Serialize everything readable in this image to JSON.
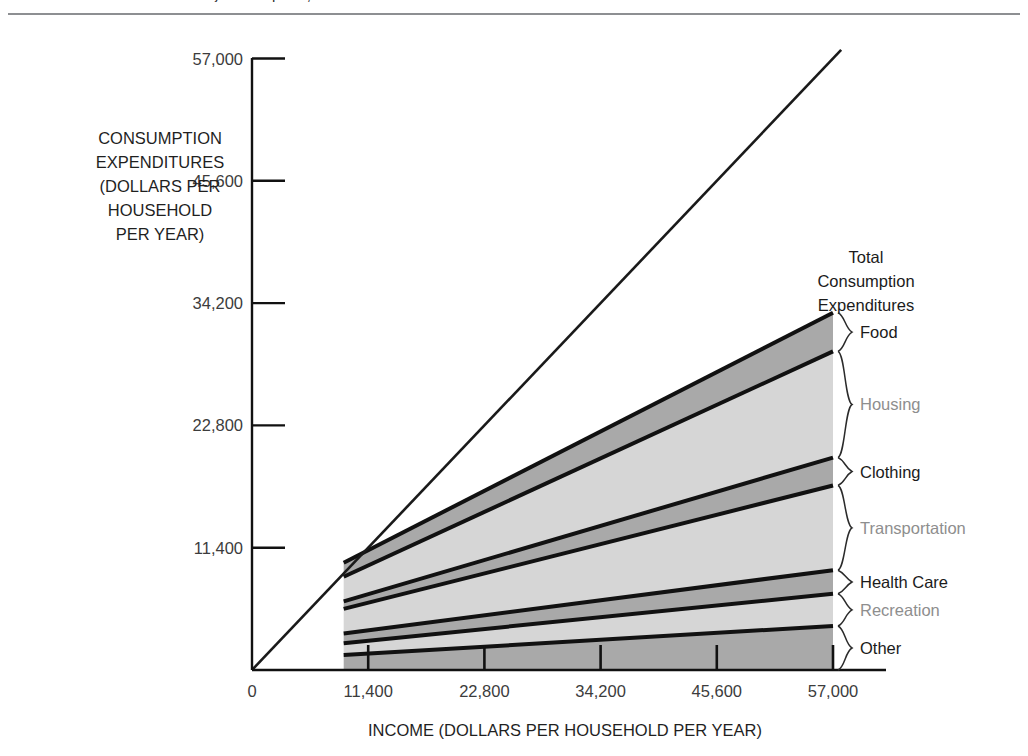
{
  "figure": {
    "clipped_header_text": "...y............p......,",
    "divider": "horizontal-rule"
  },
  "axes": {
    "y_axis_title_lines": [
      "CONSUMPTION",
      "EXPENDITURES",
      "(DOLLARS PER",
      "HOUSEHOLD",
      "PER YEAR)"
    ],
    "x_axis_title": "INCOME (DOLLARS PER HOUSEHOLD PER YEAR)",
    "y_ticks": [
      "11,400",
      "22,800",
      "34,200",
      "45,600",
      "57,000"
    ],
    "x_ticks": [
      "0",
      "11,400",
      "22,800",
      "34,200",
      "45,600",
      "57,000"
    ]
  },
  "annotations": {
    "total_label_lines": [
      "Total",
      "Consumption",
      "Expenditures"
    ],
    "identity_line_name": "45-degree-income-equals-consumption-line"
  },
  "chart_data": {
    "type": "area",
    "title": "",
    "subtitle": "",
    "xlabel": "INCOME (DOLLARS PER HOUSEHOLD PER YEAR)",
    "ylabel": "CONSUMPTION EXPENDITURES (DOLLARS PER HOUSEHOLD PER YEAR)",
    "xlim": [
      0,
      62000
    ],
    "ylim": [
      0,
      62000
    ],
    "xticks": [
      0,
      11400,
      22800,
      34200,
      45600,
      57000
    ],
    "yticks": [
      11400,
      22800,
      34200,
      45600,
      57000
    ],
    "grid": false,
    "legend": "right-side-brace-labels",
    "stacked": true,
    "x": [
      9000,
      57000
    ],
    "series": [
      {
        "name": "Other",
        "tone": "dark",
        "values": [
          1400,
          4100
        ]
      },
      {
        "name": "Recreation",
        "tone": "light",
        "values": [
          1100,
          3000
        ]
      },
      {
        "name": "Health Care",
        "tone": "dark",
        "values": [
          900,
          2200
        ]
      },
      {
        "name": "Transportation",
        "tone": "light",
        "values": [
          2300,
          7900
        ]
      },
      {
        "name": "Clothing",
        "tone": "dark",
        "values": [
          700,
          2600
        ]
      },
      {
        "name": "Housing",
        "tone": "light",
        "values": [
          2300,
          9900
        ]
      },
      {
        "name": "Food",
        "tone": "dark",
        "values": [
          1300,
          3600
        ]
      }
    ],
    "cumulative_tops": {
      "x_left": 9000,
      "x_right": 57000,
      "left": [
        1400,
        2500,
        3400,
        5700,
        6400,
        8700,
        10000
      ],
      "right": [
        4100,
        7100,
        9300,
        17200,
        19800,
        29700,
        33300
      ]
    },
    "identity_line": {
      "from": [
        0,
        0
      ],
      "to": [
        57800,
        57800
      ]
    },
    "total_line_label": "Total Consumption Expenditures",
    "colors": {
      "dark_band": "#a9a9a9",
      "light_band": "#d6d6d6",
      "band_edge": "#111111",
      "axis": "#111111",
      "dark_text": "#1b1b1b",
      "light_text": "#8e8e8e"
    }
  }
}
